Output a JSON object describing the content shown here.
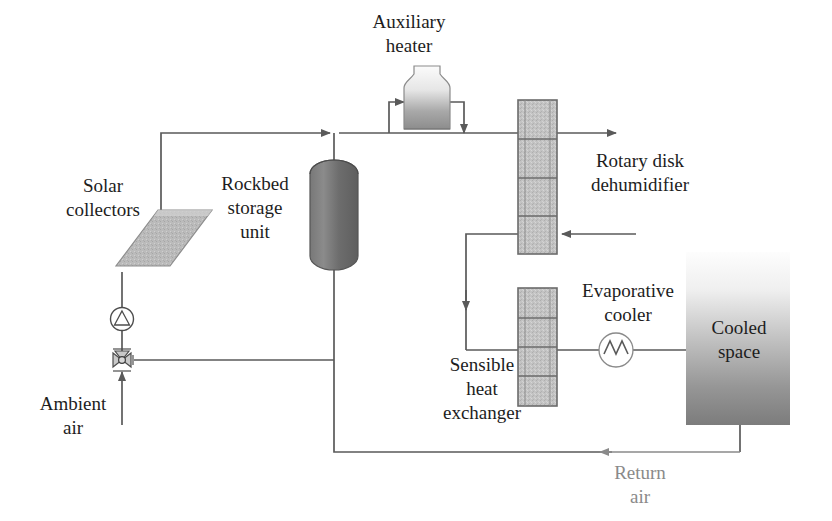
{
  "diagram": {
    "type": "process-flow-diagram",
    "background_color": "#ffffff",
    "line_color": "#5a5a5a",
    "label_color": "#1d1d1d",
    "muted_label_color": "#8a8a8a"
  },
  "labels": {
    "auxiliary_heater_line1": "Auxiliary",
    "auxiliary_heater_line2": "heater",
    "solar_collectors_line1": "Solar",
    "solar_collectors_line2": "collectors",
    "rockbed_line1": "Rockbed",
    "rockbed_line2": "storage",
    "rockbed_line3": "unit",
    "rotary_disk_line1": "Rotary disk",
    "rotary_disk_line2": "dehumidifier",
    "evaporative_cooler_line1": "Evaporative",
    "evaporative_cooler_line2": "cooler",
    "cooled_space_line1": "Cooled",
    "cooled_space_line2": "space",
    "sensible_hx_line1": "Sensible",
    "sensible_hx_line2": "heat",
    "sensible_hx_line3": "exchanger",
    "ambient_air_line1": "Ambient",
    "ambient_air_line2": "air",
    "return_air_line1": "Return",
    "return_air_line2": "air"
  },
  "components": [
    {
      "name": "solar-collectors",
      "shape": "tilted-panel",
      "fill": "#b4b4b4"
    },
    {
      "name": "rockbed-storage-unit",
      "shape": "vertical-capsule",
      "fill": "#6f6f6f"
    },
    {
      "name": "auxiliary-heater",
      "shape": "flask-vessel",
      "fill": "#9a9a9a"
    },
    {
      "name": "rotary-disk-dehumidifier",
      "shape": "segmented-column",
      "segments": 4,
      "fill": "#bdbdbd"
    },
    {
      "name": "sensible-heat-exchanger",
      "shape": "segmented-column",
      "segments": 4,
      "fill": "#bdbdbd"
    },
    {
      "name": "evaporative-cooler",
      "shape": "circle-with-zigzag",
      "fill": "#ffffff"
    },
    {
      "name": "cooled-space",
      "shape": "gradient-rectangle",
      "fill_top": "#f2f2f2",
      "fill_bottom": "#7a7a7a"
    },
    {
      "name": "circulation-pump",
      "shape": "circle-with-triangle",
      "fill": "#ffffff"
    },
    {
      "name": "three-way-valve",
      "shape": "bowtie-valve",
      "fill": "#d8d8d8"
    }
  ],
  "flow_arrows": [
    {
      "name": "ambient-air-inlet",
      "direction": "up"
    },
    {
      "name": "collector-loop-to-main-header",
      "direction": "right"
    },
    {
      "name": "heater-inlet",
      "direction": "right"
    },
    {
      "name": "heater-outlet",
      "direction": "down"
    },
    {
      "name": "regeneration-air-exhaust",
      "direction": "right"
    },
    {
      "name": "process-air-inlet",
      "direction": "left"
    },
    {
      "name": "dehumidifier-to-heat-exchanger",
      "direction": "down"
    },
    {
      "name": "return-air-to-rockbed",
      "direction": "left"
    }
  ]
}
